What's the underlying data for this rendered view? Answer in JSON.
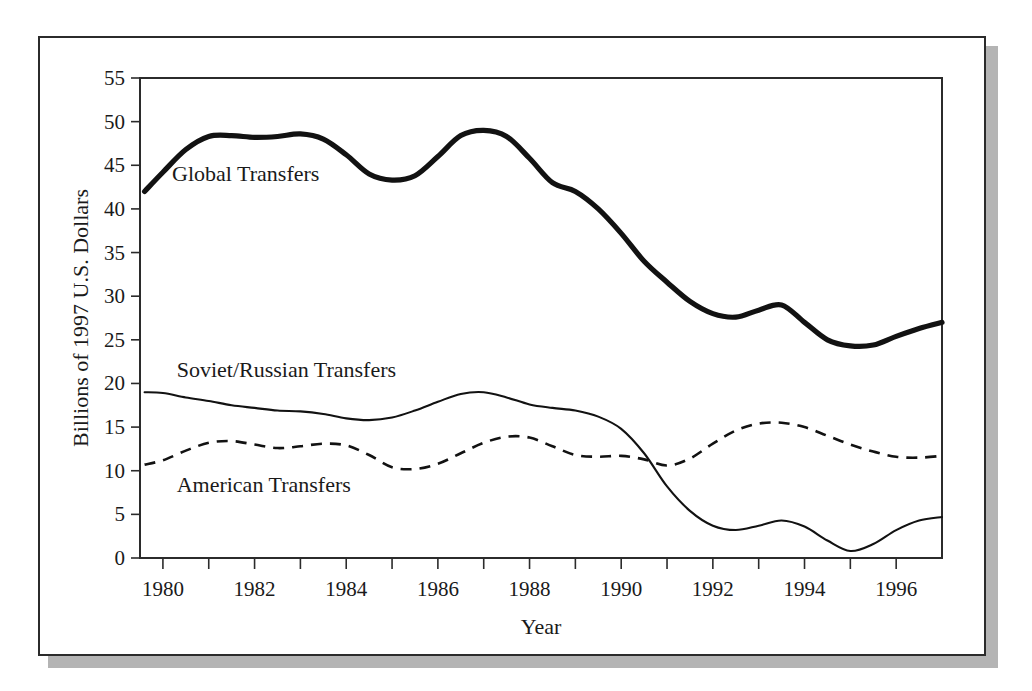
{
  "chart_data": {
    "type": "line",
    "title": "",
    "xlabel": "Year",
    "ylabel": "Billions of 1997 U.S. Dollars",
    "xlim": [
      1979.5,
      1997.0
    ],
    "ylim": [
      0,
      55
    ],
    "grid": false,
    "legend_position": "inline-labels",
    "x_tick_labels": [
      "1980",
      "1982",
      "1984",
      "1986",
      "1988",
      "1990",
      "1992",
      "1994",
      "1996"
    ],
    "x_tick_values": [
      1980,
      1982,
      1984,
      1986,
      1988,
      1990,
      1992,
      1994,
      1996
    ],
    "x_minor_tick_values": [
      1981,
      1983,
      1985,
      1987,
      1989,
      1991,
      1993,
      1995
    ],
    "y_tick_labels": [
      "0",
      "5",
      "10",
      "15",
      "20",
      "25",
      "30",
      "35",
      "40",
      "45",
      "50",
      "55"
    ],
    "y_tick_values": [
      0,
      5,
      10,
      15,
      20,
      25,
      30,
      35,
      40,
      45,
      50,
      55
    ],
    "x": [
      1979.6,
      1980,
      1980.5,
      1981,
      1981.5,
      1982,
      1982.5,
      1983,
      1983.5,
      1984,
      1984.5,
      1985,
      1985.5,
      1986,
      1986.5,
      1987,
      1987.5,
      1988,
      1988.5,
      1989,
      1989.5,
      1990,
      1990.5,
      1991,
      1991.5,
      1992,
      1992.5,
      1993,
      1993.5,
      1994,
      1994.5,
      1995,
      1995.5,
      1996,
      1996.5,
      1997
    ],
    "series": [
      {
        "name": "Global Transfers",
        "style": "thick-solid",
        "label_x": 1980.2,
        "label_y": 43.2,
        "values": [
          42.0,
          44.2,
          46.8,
          48.3,
          48.4,
          48.2,
          48.3,
          48.6,
          48.0,
          46.2,
          44.0,
          43.3,
          43.8,
          46.0,
          48.4,
          49.0,
          48.3,
          45.8,
          43.0,
          42.0,
          40.0,
          37.2,
          34.0,
          31.6,
          29.4,
          28.0,
          27.6,
          28.4,
          29.0,
          27.0,
          25.0,
          24.3,
          24.4,
          25.4,
          26.3,
          27.0
        ]
      },
      {
        "name": "Soviet/Russian Transfers",
        "style": "thin-solid",
        "label_x": 1980.3,
        "label_y": 20.7,
        "values": [
          19.0,
          18.9,
          18.4,
          18.0,
          17.5,
          17.2,
          16.9,
          16.8,
          16.5,
          16.0,
          15.8,
          16.1,
          16.9,
          17.9,
          18.8,
          19.0,
          18.4,
          17.6,
          17.2,
          16.9,
          16.2,
          14.8,
          12.0,
          8.2,
          5.4,
          3.7,
          3.2,
          3.7,
          4.3,
          3.6,
          2.0,
          0.8,
          1.6,
          3.2,
          4.3,
          4.7
        ]
      },
      {
        "name": "American Transfers",
        "style": "dashed",
        "label_x": 1980.3,
        "label_y": 7.6,
        "values": [
          10.7,
          11.2,
          12.3,
          13.2,
          13.4,
          13.0,
          12.6,
          12.8,
          13.1,
          12.9,
          11.8,
          10.4,
          10.2,
          10.8,
          12.0,
          13.2,
          13.9,
          13.8,
          12.8,
          11.8,
          11.6,
          11.7,
          11.3,
          10.6,
          11.4,
          13.1,
          14.6,
          15.4,
          15.5,
          15.0,
          14.0,
          13.0,
          12.2,
          11.6,
          11.5,
          11.7
        ]
      }
    ],
    "series_tail": {
      "global": [
        28.0,
        29.1,
        30.2
      ],
      "soviet": [
        4.6,
        4.4,
        4.2
      ],
      "american": [
        12.0,
        12.6,
        13.3
      ]
    },
    "colors": {
      "line": "#121212",
      "axis": "#2b2b2b",
      "background": "#ffffff",
      "shadow": "#b4b4b4"
    }
  }
}
